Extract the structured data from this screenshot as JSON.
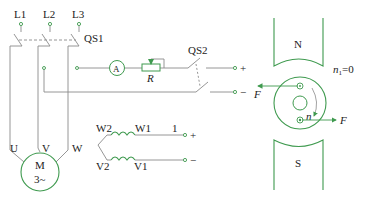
{
  "circuit": {
    "lines": [
      "L1",
      "L2",
      "L3"
    ],
    "switch_main": "QS1",
    "ammeter": "A",
    "resistor": "R",
    "switch_dc": "QS2",
    "terminal_plus": "+",
    "terminal_minus": "−",
    "motor_label": "M",
    "motor_type": "3~",
    "motor_terminals": [
      "U",
      "V",
      "W"
    ],
    "coil_top": {
      "left": "W2",
      "right": "W1"
    },
    "coil_bottom": {
      "left": "V2",
      "right": "V1"
    },
    "coil_terminal_label": "1",
    "coil_plus": "+",
    "coil_minus": "−"
  },
  "magnet": {
    "north": "N",
    "south": "S",
    "speed_label": "n",
    "speed_sub": "1",
    "speed_value": "=0",
    "rotation_label": "n",
    "force_left": "F",
    "force_right": "F"
  },
  "colors": {
    "line": "#8a8a8a",
    "green": "#3f9a4f",
    "text": "#222222"
  }
}
